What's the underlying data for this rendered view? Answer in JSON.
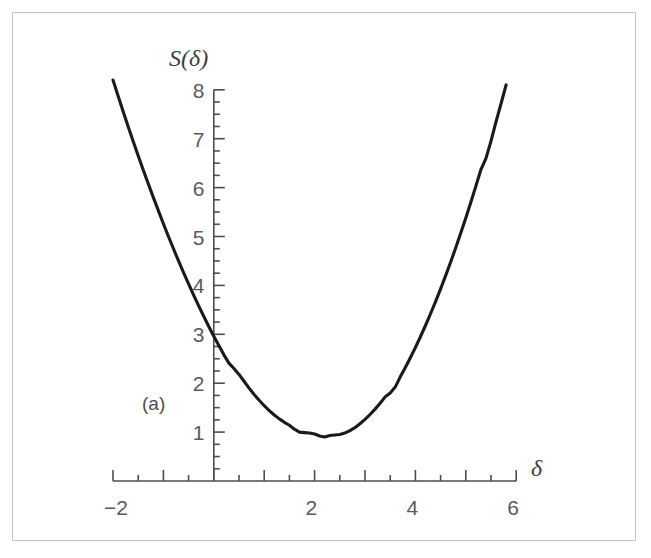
{
  "figure": {
    "panel_label": "(a)",
    "clipped_header_text": "",
    "border_color": "#c4c4c4",
    "background": "#ffffff",
    "curve_color": "#1a1a1a",
    "axis_color": "#4d4d4f",
    "label_color": "#5a5a5c"
  },
  "chart_data": {
    "type": "line",
    "title": "",
    "subtitle": "",
    "xlabel": "δ",
    "ylabel": "S(δ)",
    "annotations": [
      "(a)"
    ],
    "grid": false,
    "legend": null,
    "xlim": [
      -2,
      6
    ],
    "ylim": [
      0,
      8.4
    ],
    "x_major_ticks": [
      -2,
      -1,
      0,
      1,
      2,
      3,
      4,
      5,
      6
    ],
    "x_tick_labels": [
      "−2",
      "",
      "",
      "",
      "2",
      "",
      "4",
      "",
      "6"
    ],
    "x_labeled_ticks": [
      {
        "value": -2,
        "label": "−2"
      },
      {
        "value": 2,
        "label": "2"
      },
      {
        "value": 4,
        "label": "4"
      },
      {
        "value": 6,
        "label": "6"
      }
    ],
    "x_minor_tick_step": 0.5,
    "y_major_ticks": [
      1,
      2,
      3,
      4,
      5,
      6,
      7,
      8
    ],
    "y_tick_labels": [
      "1",
      "2",
      "3",
      "4",
      "5",
      "6",
      "7",
      "8"
    ],
    "y_minor_tick_step": 0.25,
    "series": [
      {
        "name": "S(δ)",
        "minimum": {
          "x": 2.1,
          "y": 0.87
        },
        "x": [
          -2.0,
          -1.9,
          -1.8,
          -1.7,
          -1.6,
          -1.5,
          -1.4,
          -1.3,
          -1.2,
          -1.1,
          -1.0,
          -0.9,
          -0.8,
          -0.7,
          -0.6,
          -0.5,
          -0.4,
          -0.3,
          -0.2,
          -0.1,
          0.0,
          0.1,
          0.2,
          0.3,
          0.4,
          0.5,
          0.6,
          0.7,
          0.8,
          0.9,
          1.0,
          1.1,
          1.2,
          1.3,
          1.4,
          1.5,
          1.6,
          1.7,
          1.8,
          1.9,
          2.0,
          2.1,
          2.2,
          2.3,
          2.4,
          2.5,
          2.6,
          2.7,
          2.8,
          2.9,
          3.0,
          3.1,
          3.2,
          3.3,
          3.4,
          3.5,
          3.6,
          3.7,
          3.8,
          3.9,
          4.0,
          4.1,
          4.2,
          4.3,
          4.4,
          4.5,
          4.6,
          4.7,
          4.8,
          4.9,
          5.0,
          5.1,
          5.2,
          5.3,
          5.4,
          5.5,
          5.6,
          5.7,
          5.8
        ],
        "y": [
          8.2,
          7.88,
          7.56,
          7.25,
          6.95,
          6.65,
          6.36,
          6.08,
          5.8,
          5.53,
          5.26,
          5.0,
          4.75,
          4.5,
          4.26,
          4.03,
          3.8,
          3.58,
          3.37,
          3.16,
          2.96,
          2.77,
          2.58,
          2.41,
          2.3,
          2.18,
          2.04,
          1.9,
          1.77,
          1.65,
          1.54,
          1.44,
          1.35,
          1.27,
          1.2,
          1.14,
          1.06,
          1.0,
          0.99,
          0.98,
          0.96,
          0.92,
          0.9,
          0.93,
          0.94,
          0.95,
          0.98,
          1.03,
          1.09,
          1.17,
          1.26,
          1.36,
          1.47,
          1.59,
          1.72,
          1.8,
          1.92,
          2.13,
          2.32,
          2.52,
          2.73,
          2.95,
          3.18,
          3.42,
          3.67,
          3.93,
          4.2,
          4.48,
          4.77,
          5.07,
          5.38,
          5.7,
          6.03,
          6.37,
          6.6,
          6.95,
          7.35,
          7.72,
          8.1
        ]
      }
    ]
  }
}
